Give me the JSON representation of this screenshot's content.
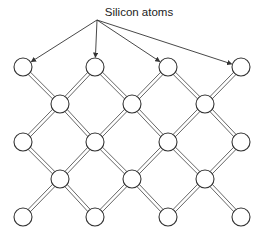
{
  "label": "Silicon atoms",
  "colors": {
    "stroke": "#333333",
    "bond": "#555555",
    "fill": "#ffffff"
  },
  "lattice": {
    "rows": [
      {
        "y": 67,
        "xs": [
          23,
          95,
          168,
          241
        ]
      },
      {
        "y": 104,
        "xs": [
          60,
          132,
          205
        ]
      },
      {
        "y": 142,
        "xs": [
          23,
          95,
          168,
          241
        ]
      },
      {
        "y": 179,
        "xs": [
          60,
          132,
          205
        ]
      },
      {
        "y": 217,
        "xs": [
          23,
          95,
          168,
          241
        ]
      }
    ],
    "atom_radius": 9
  },
  "arrows": {
    "origin": [
      97,
      20
    ],
    "targets": [
      [
        23,
        67
      ],
      [
        95,
        67
      ],
      [
        168,
        67
      ],
      [
        241,
        67
      ]
    ]
  }
}
